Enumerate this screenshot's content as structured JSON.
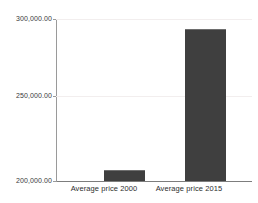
{
  "chart_data": {
    "type": "bar",
    "title": "",
    "subtitle": "",
    "xlabel": "",
    "ylabel": "",
    "categories": [
      "Average price 2000",
      "Average price 2015"
    ],
    "values": [
      207000.0,
      294000.0
    ],
    "series": [
      {
        "name": "Average price",
        "values": [
          207000.0,
          294000.0
        ]
      }
    ],
    "ylim": [
      200000.0,
      300000.0
    ],
    "yticks": [
      200000.0,
      250000.0,
      300000.0
    ],
    "ytick_labels": [
      "200,000.00",
      "250,000.00",
      "300,000.00"
    ],
    "grid": true,
    "grid_axis": "y",
    "legend": false,
    "legend_position": "none",
    "bar_color": "#3f3f3f",
    "axis_color": "#9a9a9a",
    "gridline_color": "#f2eeee",
    "background_color": "#ffffff"
  },
  "axis": {
    "y": {
      "tick_top": "300,000.00",
      "tick_mid": "250,000.00",
      "tick_bottom": "200,000.00"
    },
    "x": {
      "cat_first": "Average price 2000",
      "cat_second": "Average price 2015"
    }
  }
}
